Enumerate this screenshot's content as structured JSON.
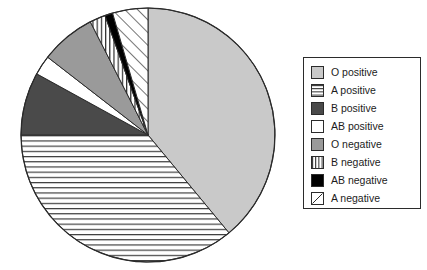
{
  "chart_data": {
    "type": "pie",
    "title": "",
    "categories": [
      "O positive",
      "A positive",
      "B positive",
      "AB positive",
      "O negative",
      "B negative",
      "AB negative",
      "A negative"
    ],
    "values": [
      39.0,
      36.0,
      8.0,
      2.5,
      7.0,
      2.0,
      1.0,
      4.5
    ],
    "units": "percent",
    "start_angle_deg": 0,
    "direction": "clockwise",
    "legend_position": "right",
    "grid": false,
    "slice_styles": [
      {
        "name": "O positive",
        "fill": "#c9c9c9",
        "pattern": "solid"
      },
      {
        "name": "A positive",
        "fill": "#ffffff",
        "pattern": "horizontal-lines"
      },
      {
        "name": "B positive",
        "fill": "#4a4a4a",
        "pattern": "solid"
      },
      {
        "name": "AB positive",
        "fill": "#ffffff",
        "pattern": "solid"
      },
      {
        "name": "O negative",
        "fill": "#9a9a9a",
        "pattern": "solid"
      },
      {
        "name": "B negative",
        "fill": "#ffffff",
        "pattern": "vertical-lines"
      },
      {
        "name": "AB negative",
        "fill": "#000000",
        "pattern": "solid"
      },
      {
        "name": "A negative",
        "fill": "#ffffff",
        "pattern": "diagonal-lines"
      }
    ],
    "outline_color": "#2b2b2b"
  },
  "legend": {
    "items": [
      {
        "label": "O positive",
        "swatch": "swatch-solid-light-gray"
      },
      {
        "label": "A positive",
        "swatch": "swatch-horizontal-lines"
      },
      {
        "label": "B positive",
        "swatch": "swatch-solid-dark-gray"
      },
      {
        "label": "AB positive",
        "swatch": "swatch-solid-white"
      },
      {
        "label": "O negative",
        "swatch": "swatch-solid-mid-gray"
      },
      {
        "label": "B negative",
        "swatch": "swatch-vertical-lines"
      },
      {
        "label": "AB negative",
        "swatch": "swatch-solid-black"
      },
      {
        "label": "A negative",
        "swatch": "swatch-diagonal-lines"
      }
    ]
  }
}
